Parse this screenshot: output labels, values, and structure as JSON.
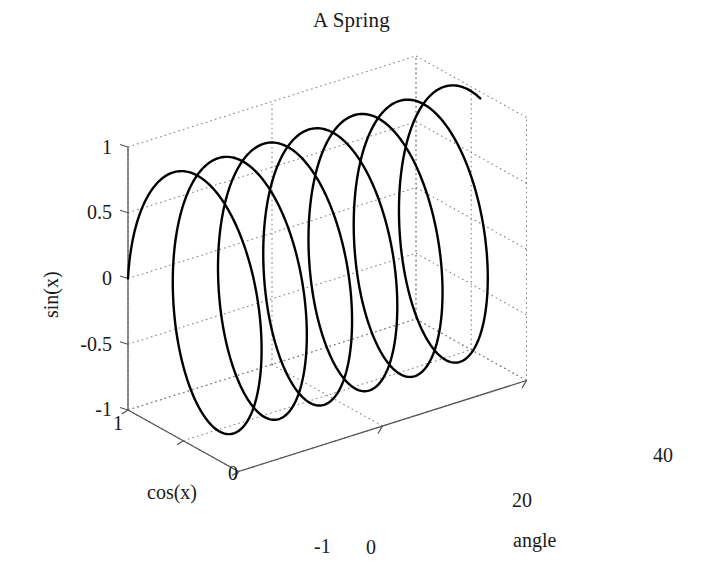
{
  "figure": {
    "title": "A Spring",
    "background_color": "#ffffff",
    "line_color": "#000000",
    "axis_color": "#555555",
    "grid_color": "#808080",
    "width": 703,
    "height": 579
  },
  "chart_data": {
    "type": "line",
    "plot_style": "3d-parametric-helix",
    "title": "A Spring",
    "xlabel": "angle",
    "ylabel": "cos(x)",
    "zlabel": "sin(x)",
    "xlim": [
      0,
      40
    ],
    "ylim": [
      -1,
      1
    ],
    "zlim": [
      -1,
      1
    ],
    "xticks": [
      0,
      20,
      40
    ],
    "xtick_labels": [
      "0",
      "20",
      "40"
    ],
    "yticks": [
      1,
      0,
      -1
    ],
    "ytick_labels": [
      "1",
      "0",
      "-1"
    ],
    "zticks": [
      1,
      0.5,
      0,
      -0.5,
      -1
    ],
    "ztick_labels": [
      "1",
      "0.5",
      "0",
      "-0.5",
      "-1"
    ],
    "grid": true,
    "grid_style": "dotted",
    "legend": null,
    "series": [
      {
        "name": "spring",
        "parametric": true,
        "param": "x",
        "param_range": [
          0,
          39.5
        ],
        "x_expr": "x",
        "y_expr": "cos(x)",
        "z_expr": "sin(x)",
        "turns": 6.28,
        "line_width": 2.4,
        "color": "#000000"
      }
    ],
    "view": {
      "projection": "orthographic",
      "origin_px": [
        128,
        410
      ],
      "x_unit_px": [
        7.2,
        -2.275
      ],
      "y_unit_px": [
        -55.25,
        -30.75
      ],
      "z_unit_px": [
        0,
        -131.5
      ]
    }
  },
  "axes": {
    "z": {
      "label": "sin(x)",
      "ticks": [
        {
          "value": 1,
          "text": "1"
        },
        {
          "value": 0.5,
          "text": "0.5"
        },
        {
          "value": 0,
          "text": "0"
        },
        {
          "value": -0.5,
          "text": "-0.5"
        },
        {
          "value": -1,
          "text": "-1"
        }
      ]
    },
    "y": {
      "label": "cos(x)",
      "ticks": [
        {
          "value": 1,
          "text": "1"
        },
        {
          "value": 0,
          "text": "0"
        },
        {
          "value": -1,
          "text": "-1"
        }
      ]
    },
    "x": {
      "label": "angle",
      "ticks": [
        {
          "value": 0,
          "text": "0"
        },
        {
          "value": 20,
          "text": "20"
        },
        {
          "value": 40,
          "text": "40"
        }
      ]
    }
  }
}
